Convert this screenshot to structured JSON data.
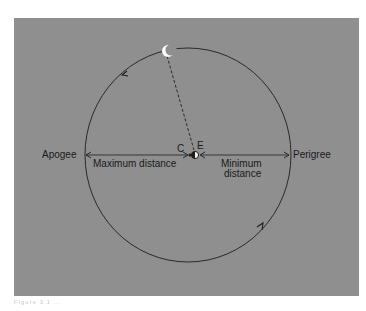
{
  "figure": {
    "type": "orbit-diagram",
    "labels": {
      "apogee": "Apogee",
      "perigee": "Perigree",
      "max_distance": "Maximum distance",
      "min_distance_line1": "Minimum",
      "min_distance_line2": "distance",
      "center": "C",
      "earth": "E"
    },
    "caption": "Figure 3.1 ...",
    "colors": {
      "panel": "#8f8f8f",
      "line": "#1e1e1e",
      "moon": "#ffffff",
      "page": "#ffffff"
    },
    "geometry": {
      "orbit_center": [
        188,
        155
      ],
      "orbit_rx": 103,
      "orbit_ry": 107,
      "moon_position": [
        165,
        51
      ],
      "earth_position": [
        194,
        155
      ],
      "orbit_direction": "counter-clockwise"
    }
  }
}
